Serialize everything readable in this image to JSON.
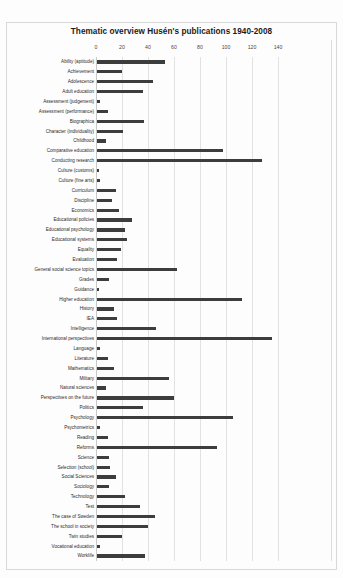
{
  "document": {
    "kind": "scanned-figure-page"
  },
  "chart_data": {
    "type": "bar",
    "orientation": "horizontal",
    "title": "Thematic overview Husén's publications 1940-2008",
    "xlabel": "",
    "ylabel": "",
    "xlim": [
      0,
      160
    ],
    "xticks": [
      0,
      20,
      40,
      60,
      80,
      100,
      120,
      140
    ],
    "xtick_labels": [
      "0",
      "20",
      "40",
      "60",
      "80",
      "100",
      "120",
      "140"
    ],
    "grid": true,
    "grid_axis": "x",
    "legend": false,
    "bar_color": "#3d3d3d",
    "categories": [
      "Ability (aptitude)",
      "Achievement",
      "Adolescence",
      "Adult education",
      "Assessment (judgement)",
      "Assessment (performance)",
      "Biographica",
      "Character (individuality)",
      "Childhood",
      "Comparative education",
      "Conducting research",
      "Culture (customs)",
      "Culture (fine arts)",
      "Curriculum",
      "Discipline",
      "Economics",
      "Educational policies",
      "Educational psychology",
      "Educational systems",
      "Equality",
      "Evaluation",
      "General social science topics",
      "Grades",
      "Guidance",
      "Higher education",
      "History",
      "IEA",
      "Intelligence",
      "International perspectives",
      "Language",
      "Literature",
      "Mathematics",
      "Military",
      "Natural sciences",
      "Perspectives on the future",
      "Politics",
      "Psychology",
      "Psychometrics",
      "Reading",
      "Reforms",
      "Science",
      "Selection (school)",
      "Social Sciences",
      "Sociology",
      "Technology",
      "Test",
      "The case of Sweden",
      "The school in society",
      "Twin studies",
      "Vocational education",
      "Worklife"
    ],
    "values": [
      53,
      20,
      44,
      36,
      3,
      9,
      37,
      21,
      8,
      98,
      128,
      2,
      3,
      15,
      12,
      18,
      28,
      22,
      24,
      19,
      16,
      62,
      10,
      2,
      112,
      14,
      16,
      46,
      135,
      3,
      9,
      14,
      56,
      8,
      60,
      36,
      105,
      3,
      9,
      93,
      10,
      11,
      15,
      10,
      22,
      34,
      45,
      40,
      20,
      3,
      38
    ]
  }
}
